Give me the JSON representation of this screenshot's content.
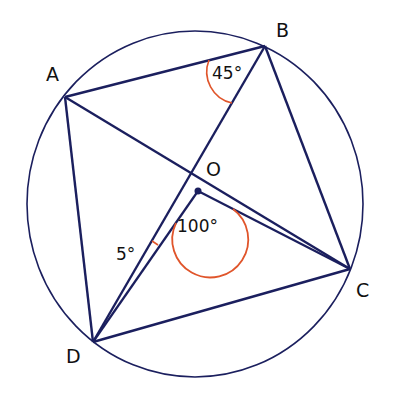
{
  "diagram": {
    "type": "circle-geometry",
    "points": {
      "A": {
        "label": "A",
        "x": 65,
        "y": 97
      },
      "B": {
        "label": "B",
        "x": 265,
        "y": 46
      },
      "C": {
        "label": "C",
        "x": 350,
        "y": 269
      },
      "D": {
        "label": "D",
        "x": 93,
        "y": 342
      },
      "O": {
        "label": "O",
        "x": 198,
        "y": 191
      }
    },
    "center_label": "O",
    "angles": {
      "ABD": {
        "label": "45°",
        "color": "#e0552b"
      },
      "DOC": {
        "label": "100°",
        "color": "#e0552b"
      },
      "BDO": {
        "label": "5°",
        "color": "#e0552b"
      }
    },
    "line_color": "#1b1f5e",
    "arc_color": "#e0552b"
  }
}
